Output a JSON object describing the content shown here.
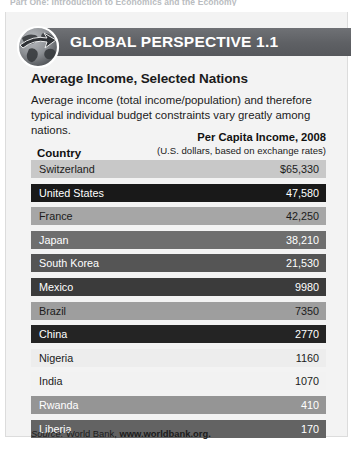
{
  "running_head": "Part One: Introduction to Economics and the Economy",
  "banner": {
    "title": "GLOBAL PERSPECTIVE 1.1",
    "icon": "globe-icon",
    "bar_color": "#5e6064",
    "text_color": "#ffffff"
  },
  "headline": "Average Income, Selected Nations",
  "blurb": "Average income (total income/population) and therefore typical individual budget constraints vary greatly among nations.",
  "table": {
    "col_country": "Country",
    "col_value_line1": "Per Capita Income, 2008",
    "col_value_line2": "(U.S. dollars, based on exchange rates)",
    "rows": [
      {
        "country": "Switzerland",
        "value": "$65,330",
        "bg": "#c8c8c8",
        "fg": "#1b1b1b"
      },
      {
        "country": "United States",
        "value": "47,580",
        "bg": "#191919",
        "fg": "#ffffff"
      },
      {
        "country": "France",
        "value": "42,250",
        "bg": "#a6a6a6",
        "fg": "#1b1b1b"
      },
      {
        "country": "Japan",
        "value": "38,210",
        "bg": "#6e6e6e",
        "fg": "#ffffff"
      },
      {
        "country": "South Korea",
        "value": "21,530",
        "bg": "#555555",
        "fg": "#ffffff"
      },
      {
        "country": "Mexico",
        "value": "9980",
        "bg": "#3b3b3b",
        "fg": "#ffffff"
      },
      {
        "country": "Brazil",
        "value": "7350",
        "bg": "#9e9e9e",
        "fg": "#1b1b1b"
      },
      {
        "country": "China",
        "value": "2770",
        "bg": "#242424",
        "fg": "#ffffff"
      },
      {
        "country": "Nigeria",
        "value": "1160",
        "bg": "#ededed",
        "fg": "#1b1b1b"
      },
      {
        "country": "India",
        "value": "1070",
        "bg": "#f2f2f2",
        "fg": "#1b1b1b"
      },
      {
        "country": "Rwanda",
        "value": "410",
        "bg": "#959595",
        "fg": "#ffffff"
      },
      {
        "country": "Liberia",
        "value": "170",
        "bg": "#636363",
        "fg": "#ffffff"
      }
    ]
  },
  "source": {
    "lead": "Source: ",
    "text": "World Bank, ",
    "url": "www.worldbank.org."
  },
  "chart_data": {
    "type": "table",
    "title": "Average Income, Selected Nations",
    "categories": [
      "Switzerland",
      "United States",
      "France",
      "Japan",
      "South Korea",
      "Mexico",
      "Brazil",
      "China",
      "Nigeria",
      "India",
      "Rwanda",
      "Liberia"
    ],
    "values": [
      65330,
      47580,
      42250,
      38210,
      21530,
      9980,
      7350,
      2770,
      1160,
      1070,
      410,
      170
    ],
    "xlabel": "Country",
    "ylabel": "Per Capita Income, 2008 (U.S. dollars, based on exchange rates)",
    "ylim": [
      0,
      65330
    ],
    "grid": false,
    "legend": "none"
  }
}
